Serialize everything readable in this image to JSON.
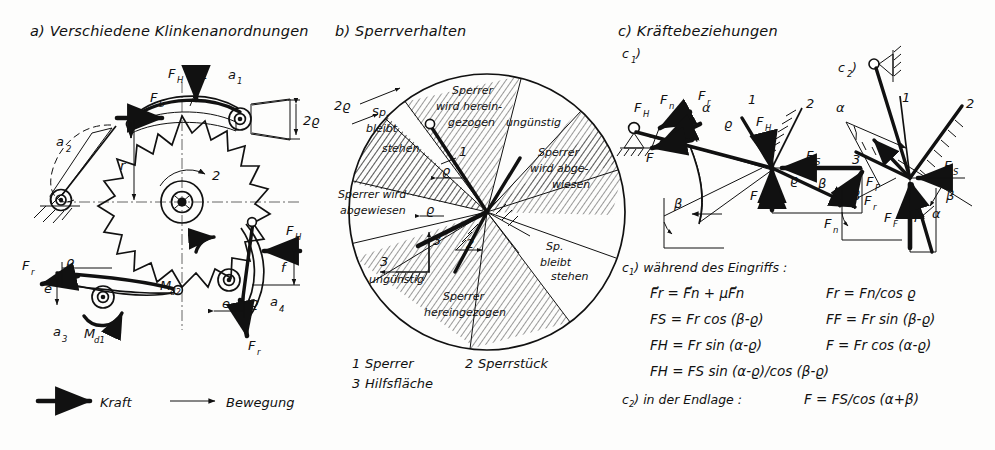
{
  "figure": {
    "type": "technical-line-drawing",
    "language": "de"
  },
  "panel_a": {
    "header": "a) Verschiedene Klinkenanordnungen",
    "variant_labels": [
      "a",
      "a",
      "a",
      "a"
    ],
    "variant_subs": [
      "1",
      "2",
      "3",
      "4"
    ],
    "labels": {
      "fh": "F",
      "fh_sub": "H",
      "fs": "F",
      "fs_sub": "S",
      "fr": "F",
      "fr_sub": "r",
      "two_rho": "2ϱ",
      "rho": "ϱ",
      "radius": "r",
      "f_small": "f",
      "e": "e",
      "md1": "M",
      "md1_sub": "d1",
      "md2": "M",
      "md2_sub": "d2",
      "num1": "1",
      "num2": "2"
    }
  },
  "panel_b": {
    "header": "b) Sperrverhalten",
    "two_rho": "2ϱ",
    "sectors": [
      {
        "id": "s1",
        "lines": [
          "Sperrer",
          "wird herein-",
          "gezogen"
        ]
      },
      {
        "id": "s2",
        "lines": [
          "ungünstig"
        ]
      },
      {
        "id": "s3",
        "lines": [
          "Sperrer",
          "wird abge-",
          "wiesen"
        ]
      },
      {
        "id": "s4",
        "lines": [
          "Sp.",
          "bleibt",
          "stehen"
        ]
      },
      {
        "id": "s5",
        "lines": [
          "Sperrer",
          "wird",
          "hereingezogen"
        ]
      },
      {
        "id": "s6",
        "lines": [
          "ungünstig"
        ]
      },
      {
        "id": "s7",
        "lines": [
          "Sperrer wird",
          "abgewiesen"
        ]
      },
      {
        "id": "s8",
        "lines": [
          "Sp.",
          "bleibt",
          "stehen"
        ]
      }
    ],
    "center_numbers": [
      "1",
      "2",
      "3"
    ],
    "center_rho": "ϱ",
    "key": [
      {
        "num": "1",
        "text": "Sperrer"
      },
      {
        "num": "2",
        "text": "Sperrstück"
      },
      {
        "num": "3",
        "text": "Hilfsfläche"
      }
    ]
  },
  "panel_c": {
    "header": "c) Kräftebeziehungen",
    "sub_c1": "c",
    "sub_c1_idx": "1",
    "sub_c2": "c",
    "sub_c2_idx": "2",
    "diagram_labels": {
      "fn": "F",
      "fn_sub": "n",
      "fr": "F",
      "fr_sub": "r",
      "fh": "F",
      "fh_sub": "H",
      "fs": "F",
      "fs_sub": "S",
      "ff": "F",
      "ff_sub": "F",
      "f": "F",
      "alpha": "α",
      "beta": "β",
      "rho": "ϱ",
      "num1": "1",
      "num2": "2",
      "num3": "3"
    },
    "formula_block": {
      "title_c1": "c",
      "title_c1_idx": "1",
      "title_c1_text": ") während des Eingriffs :",
      "rows": [
        {
          "left": "F⃗r = F⃗n + μF⃗n",
          "right": "Fr = Fn/cos ϱ"
        },
        {
          "left": "FS = Fr cos (β-ϱ)",
          "right": "FF = Fr sin (β-ϱ)"
        },
        {
          "left": "FH = Fr sin (α-ϱ)",
          "right": "F = Fr cos (α-ϱ)"
        }
      ],
      "row_full": "FH = FS sin (α-ϱ)/cos (β-ϱ)",
      "title_c2": "c",
      "title_c2_idx": "2",
      "title_c2_text": ") in der Endlage :",
      "c2_formula": "F = FS/cos (α+β)"
    }
  },
  "legend": {
    "items": [
      {
        "name": "kraft",
        "label": "Kraft",
        "style": "thick-arrow"
      },
      {
        "name": "bewegung",
        "label": "Bewegung",
        "style": "thin-arrow"
      }
    ]
  },
  "colors": {
    "ink": "#111111",
    "paper": "#fdfdfc",
    "centerline": "#555555"
  }
}
